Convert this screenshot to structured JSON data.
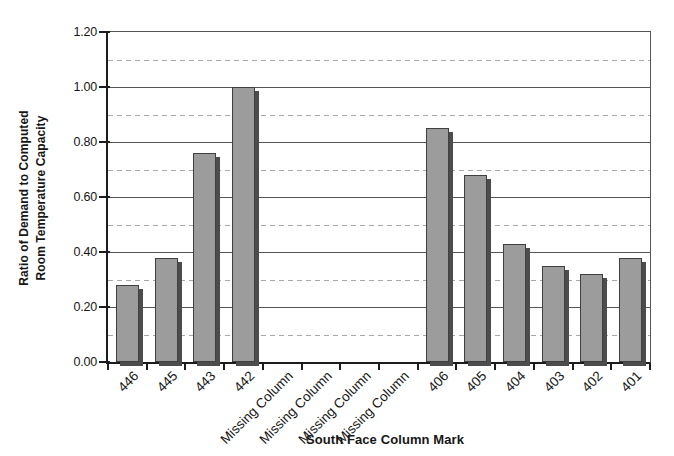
{
  "chart_data": {
    "type": "bar",
    "title": "",
    "categories": [
      "446",
      "445",
      "443",
      "442",
      "Missing Column",
      "Missing Column",
      "Missing Column",
      "Missing Column",
      "406",
      "405",
      "404",
      "403",
      "402",
      "401"
    ],
    "values": [
      0.28,
      0.38,
      0.76,
      1.0,
      0,
      0,
      0,
      0,
      0.85,
      0.68,
      0.43,
      0.35,
      0.32,
      0.38
    ],
    "xlabel": "South Face Column Mark",
    "ylabel_line1": "Ratio of Demand to Computed",
    "ylabel_line2": "Room Temperature Capacity",
    "ylim": [
      0,
      1.2
    ],
    "ytick_step": 0.2,
    "minor_grid_step": 0.1,
    "ytick_labels": [
      "0.00",
      "0.20",
      "0.40",
      "0.60",
      "0.80",
      "1.00",
      "1.20"
    ],
    "grid": "major solid, minor dashed",
    "legend": "none",
    "colors": {
      "bar_fill": "#9c9c9c",
      "bar_border": "#3f3f3f",
      "bar_shadow": "#4c4c4c",
      "grid_solid": "#555555",
      "grid_dashed": "#a8a8a8",
      "axis": "#1c1c1c",
      "text": "#161616",
      "background": "#ffffff"
    }
  }
}
